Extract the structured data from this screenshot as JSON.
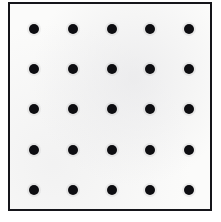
{
  "figure": {
    "canvas_width": 221,
    "canvas_height": 222,
    "page_background_color": "#ffffff",
    "frame": {
      "label": "plot frame",
      "left": 8,
      "top": 2,
      "width": 204,
      "height": 209,
      "border_width": 2,
      "border_color": "#15151a",
      "fill_color": "#fbfbfa"
    },
    "dot_style": {
      "color": "#0d0d11",
      "diameter": 10,
      "shape": "circle"
    },
    "grid": {
      "columns": 5,
      "rows": 5,
      "column_centers_x": [
        34,
        73,
        112,
        150,
        189
      ],
      "row_centers_y": [
        29,
        69,
        109,
        150,
        190
      ],
      "column_spacing": 39,
      "row_spacing": 40,
      "total_dots": 25
    }
  },
  "chart_data": {
    "type": "scatter",
    "xlabel": "",
    "ylabel": "",
    "grid": false,
    "legend": null,
    "axis_visible": false,
    "categories": [
      "c1",
      "c2",
      "c3",
      "c4",
      "c5"
    ],
    "x": [
      34,
      73,
      112,
      150,
      189,
      34,
      73,
      112,
      150,
      189,
      34,
      73,
      112,
      150,
      189,
      34,
      73,
      112,
      150,
      189,
      34,
      73,
      112,
      150,
      189
    ],
    "y": [
      29,
      29,
      29,
      29,
      29,
      69,
      69,
      69,
      69,
      69,
      109,
      109,
      109,
      109,
      109,
      150,
      150,
      150,
      150,
      150,
      190,
      190,
      190,
      190,
      190
    ],
    "xlim": [
      8,
      212
    ],
    "ylim": [
      2,
      211
    ],
    "marker": "circle",
    "marker_size": 10,
    "marker_color": "#0d0d11",
    "series": [
      {
        "name": "row-1",
        "x": [
          34,
          73,
          112,
          150,
          189
        ],
        "y": [
          29,
          29,
          29,
          29,
          29
        ]
      },
      {
        "name": "row-2",
        "x": [
          34,
          73,
          112,
          150,
          189
        ],
        "y": [
          69,
          69,
          69,
          69,
          69
        ]
      },
      {
        "name": "row-3",
        "x": [
          34,
          73,
          112,
          150,
          189
        ],
        "y": [
          109,
          109,
          109,
          109,
          109
        ]
      },
      {
        "name": "row-4",
        "x": [
          34,
          73,
          112,
          150,
          189
        ],
        "y": [
          150,
          150,
          150,
          150,
          150
        ]
      },
      {
        "name": "row-5",
        "x": [
          34,
          73,
          112,
          150,
          189
        ],
        "y": [
          190,
          190,
          190,
          190,
          190
        ]
      }
    ]
  }
}
